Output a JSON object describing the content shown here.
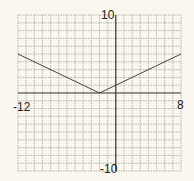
{
  "chart_data": {
    "type": "line",
    "title": "",
    "xlabel": "",
    "ylabel": "",
    "xlim": [
      -12,
      8
    ],
    "ylim": [
      -10,
      10
    ],
    "grid": true,
    "grid_step": 1,
    "tick_labels": {
      "x_min": "-12",
      "x_max": "8",
      "y_max": "10",
      "y_min": "-10"
    },
    "series": [
      {
        "name": "y = 0.5|x + 2|",
        "x": [
          -12,
          -2,
          8
        ],
        "y": [
          5,
          0,
          5
        ]
      }
    ]
  },
  "colors": {
    "background": "#f9f7ee",
    "grid": "#9a9a96",
    "axis": "#333333",
    "line": "#444444"
  }
}
